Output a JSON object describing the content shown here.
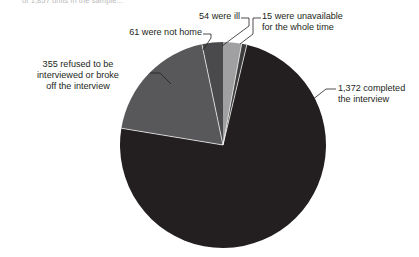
{
  "figure": {
    "caption_top": "of 1,857 units in the sample...",
    "background": "#ffffff",
    "text_color": "#231f20"
  },
  "chart_data": {
    "type": "pie",
    "title": "",
    "subtitle": "",
    "xlabel": "",
    "ylabel": "",
    "total": 1857,
    "units": "units in the sample",
    "legend_position": "none",
    "labels_position": "outside-with-leader-lines",
    "grid": false,
    "start_angle_deg": -90,
    "direction": "clockwise",
    "categories": [
      "15 were unavailable for the whole time",
      "1,372 completed the interview",
      "355 refused to be interviewed or broke off the interview",
      "61 were not home",
      "54 were ill"
    ],
    "values": [
      15,
      1372,
      355,
      61,
      54
    ],
    "slices": [
      {
        "key": "unavailable",
        "value": 15,
        "label": "15 were unavailable\nfor the whole time",
        "percent": 0.8,
        "angle_deg": 2.9,
        "color": "#3d3d3d"
      },
      {
        "key": "completed",
        "value": 1372,
        "label": "1,372 completed\nthe interview",
        "percent": 73.9,
        "angle_deg": 266.0,
        "color": "#231f20"
      },
      {
        "key": "refused",
        "value": 355,
        "label": "355 refused to be\ninterviewed or broke\noff the interview",
        "percent": 19.1,
        "angle_deg": 68.8,
        "color": "#58585a"
      },
      {
        "key": "not_home",
        "value": 61,
        "label": "61 were not home",
        "percent": 3.3,
        "angle_deg": 11.8,
        "color": "#4a4a4c"
      },
      {
        "key": "ill",
        "value": 54,
        "label": "54 were ill",
        "percent": 2.9,
        "angle_deg": 10.5,
        "color": "#a0a0a2"
      }
    ]
  },
  "labels": {
    "ill": "54 were ill",
    "unavailable": "15 were unavailable\nfor the whole time",
    "not_home": "61 were not home",
    "refused": "355 refused to be\ninterviewed or broke\noff the interview",
    "completed": "1,372 completed\nthe interview"
  }
}
